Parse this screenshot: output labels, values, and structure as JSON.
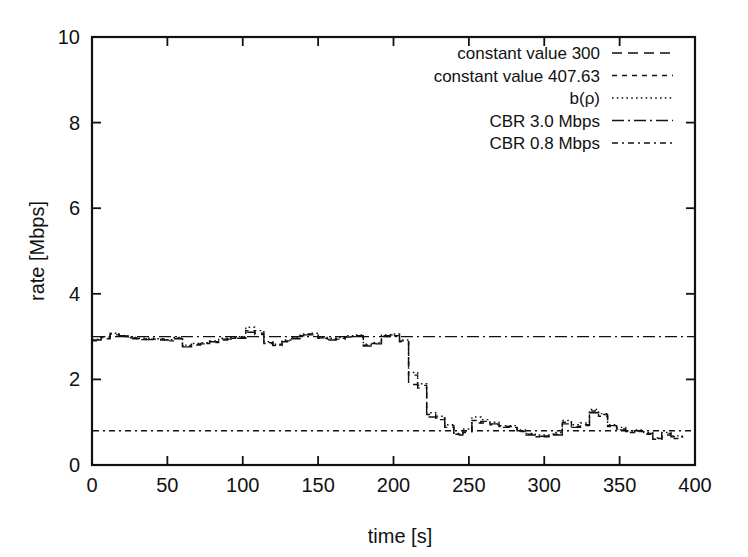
{
  "chart_data": {
    "type": "line",
    "title": "",
    "xlabel": "time [s]",
    "ylabel": "rate [Mbps]",
    "xlim": [
      0,
      400
    ],
    "ylim": [
      0,
      10
    ],
    "xticks": [
      "0",
      "50",
      "100",
      "150",
      "200",
      "250",
      "300",
      "350",
      "400"
    ],
    "yticks": [
      "0",
      "2",
      "4",
      "6",
      "8",
      "10"
    ],
    "xtick_values": [
      0,
      50,
      100,
      150,
      200,
      250,
      300,
      350,
      400
    ],
    "ytick_values": [
      0,
      2,
      4,
      6,
      8,
      10
    ],
    "grid": false,
    "legend_position": "top-right",
    "line_color": "#111111",
    "frame_color": "#111111",
    "background": "#ffffff",
    "legend": [
      {
        "label": "constant value 300",
        "dash": "10,6",
        "width": 1.4
      },
      {
        "label": "constant value 407.63",
        "dash": "5,5",
        "width": 1.4
      },
      {
        "label": "b(ρ)",
        "dash": "1.6,3.2",
        "width": 1.4
      },
      {
        "label": "CBR 3.0 Mbps",
        "dash": "12,4,2,4",
        "width": 1.4
      },
      {
        "label": "CBR 0.8 Mbps",
        "dash": "6,4,2,4",
        "width": 1.4
      }
    ],
    "series": [
      {
        "name": "constant value 300",
        "dash": "10,6",
        "step": true,
        "x": [
          0,
          6,
          12,
          18,
          24,
          30,
          36,
          42,
          48,
          54,
          60,
          66,
          72,
          78,
          84,
          90,
          96,
          102,
          108,
          114,
          120,
          126,
          132,
          138,
          144,
          150,
          156,
          162,
          168,
          174,
          180,
          186,
          192,
          198,
          204,
          210,
          216,
          222,
          228,
          234,
          240,
          246,
          252,
          258,
          264,
          270,
          276,
          282,
          288,
          294,
          300,
          306,
          312,
          318,
          324,
          330,
          336,
          342,
          348,
          354,
          360,
          366,
          372,
          378,
          384,
          392
        ],
        "values": [
          2.92,
          2.95,
          3.06,
          3.02,
          2.97,
          2.95,
          2.93,
          2.94,
          2.92,
          2.95,
          2.76,
          2.8,
          2.83,
          2.88,
          2.92,
          2.94,
          2.96,
          3.1,
          3.05,
          2.86,
          2.79,
          2.88,
          2.95,
          3.04,
          3.06,
          2.97,
          2.92,
          2.96,
          2.99,
          3.02,
          2.78,
          2.83,
          3.02,
          3.04,
          2.88,
          1.88,
          1.8,
          1.12,
          1.1,
          0.92,
          0.7,
          0.76,
          0.98,
          1.02,
          0.96,
          0.88,
          0.9,
          0.8,
          0.7,
          0.67,
          0.66,
          0.7,
          0.96,
          0.88,
          0.92,
          1.22,
          1.18,
          0.92,
          0.82,
          0.78,
          0.8,
          0.74,
          0.62,
          0.74,
          0.66,
          0.66
        ]
      },
      {
        "name": "constant value 407.63",
        "dash": "5,5",
        "step": true,
        "x": [
          0,
          6,
          12,
          18,
          24,
          30,
          36,
          42,
          48,
          54,
          60,
          66,
          72,
          78,
          84,
          90,
          96,
          102,
          108,
          114,
          120,
          126,
          132,
          138,
          144,
          150,
          156,
          162,
          168,
          174,
          180,
          186,
          192,
          198,
          204,
          210,
          216,
          222,
          228,
          234,
          240,
          246,
          252,
          258,
          264,
          270,
          276,
          282,
          288,
          294,
          300,
          306,
          312,
          318,
          324,
          330,
          336,
          342,
          348,
          354,
          360,
          366,
          372,
          378,
          384,
          392
        ],
        "values": [
          2.9,
          2.98,
          3.04,
          3.0,
          2.95,
          2.93,
          2.94,
          2.92,
          2.9,
          2.96,
          2.78,
          2.82,
          2.84,
          2.86,
          2.94,
          2.96,
          2.98,
          3.14,
          3.08,
          2.84,
          2.8,
          2.9,
          2.96,
          3.02,
          3.04,
          2.96,
          2.94,
          2.94,
          3.0,
          3.0,
          2.8,
          2.84,
          3.0,
          3.02,
          2.9,
          2.1,
          1.86,
          1.18,
          1.06,
          0.88,
          0.72,
          0.8,
          1.04,
          0.98,
          0.94,
          0.9,
          0.88,
          0.78,
          0.72,
          0.66,
          0.68,
          0.72,
          1.0,
          0.9,
          0.94,
          1.26,
          1.14,
          0.9,
          0.84,
          0.76,
          0.78,
          0.72,
          0.6,
          0.7,
          0.62,
          0.64
        ]
      },
      {
        "name": "b(ρ)",
        "dash": "1.6,3.2",
        "step": true,
        "x": [
          0,
          6,
          12,
          18,
          24,
          30,
          36,
          42,
          48,
          54,
          60,
          66,
          72,
          78,
          84,
          90,
          96,
          102,
          108,
          114,
          120,
          126,
          132,
          138,
          144,
          150,
          156,
          162,
          168,
          174,
          180,
          186,
          192,
          198,
          204,
          210,
          216,
          222,
          228,
          234,
          240,
          246,
          252,
          258,
          264,
          270,
          276,
          282,
          288,
          294,
          300,
          306,
          312,
          318,
          324,
          330,
          336,
          342,
          348,
          354,
          360,
          366,
          372,
          378,
          384,
          392
        ],
        "values": [
          2.94,
          3.0,
          3.08,
          3.02,
          2.98,
          2.96,
          2.96,
          2.95,
          2.93,
          2.98,
          2.8,
          2.84,
          2.86,
          2.9,
          2.96,
          2.98,
          3.0,
          3.22,
          3.14,
          2.88,
          2.82,
          2.92,
          2.98,
          3.06,
          3.08,
          2.98,
          2.96,
          2.98,
          3.02,
          3.04,
          2.82,
          2.86,
          3.04,
          3.06,
          2.92,
          2.16,
          1.9,
          1.22,
          1.14,
          0.94,
          0.74,
          0.84,
          1.12,
          1.06,
          1.0,
          0.92,
          0.92,
          0.82,
          0.74,
          0.7,
          0.7,
          0.76,
          1.04,
          0.94,
          0.98,
          1.3,
          1.2,
          0.94,
          0.88,
          0.8,
          0.82,
          0.76,
          0.64,
          0.76,
          0.68,
          0.68
        ]
      }
    ],
    "constant_lines": [
      {
        "name": "CBR 3.0 Mbps",
        "value": 3.0,
        "dash": "12,4,2,4"
      },
      {
        "name": "CBR 0.8 Mbps",
        "value": 0.8,
        "dash": "6,4,2,4"
      }
    ]
  }
}
